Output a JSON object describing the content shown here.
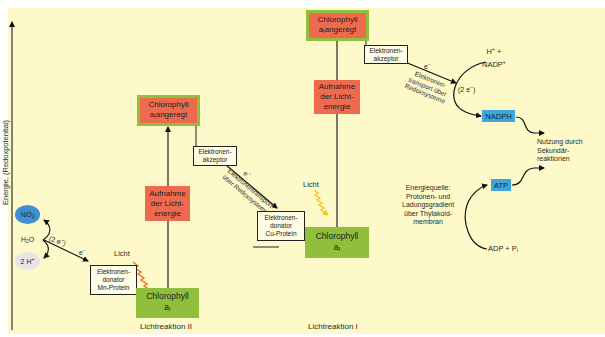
{
  "axis": {
    "label": "Energie, (Redoxpotential)"
  },
  "photosystem_II": {
    "caption": "Lichtreaktion II",
    "chlorophyll_ground": {
      "line1": "Chlorophyll",
      "line2": "a",
      "sub": "I"
    },
    "chlorophyll_excited": {
      "line1": "Chlorophyll",
      "line2a": "a",
      "sub": "I",
      "line2b": "angeregt"
    },
    "light_absorption": {
      "line1": "Aufnahme",
      "line2": "der Licht-",
      "line3": "energie"
    },
    "light_label": "Licht",
    "donor": {
      "line1": "Elektronen-",
      "line2": "donator",
      "line3": "Mn-Protein"
    },
    "acceptor": {
      "line1": "Elektronen-",
      "line2": "akzeptor"
    },
    "transport": {
      "electron": "e",
      "electron_sup": "−",
      "line1": "Elektronentransport",
      "line2": "über Redoxsysteme"
    }
  },
  "photosystem_I": {
    "caption": "Lichtreaktion I",
    "chlorophyll_ground": {
      "line1": "Chlorophyll",
      "line2": "a",
      "sub": "I"
    },
    "chlorophyll_excited": {
      "line1": "Chlorophyll",
      "line2a": "a",
      "sub": "I",
      "line2b": "angeregt"
    },
    "light_absorption": {
      "line1": "Aufnahme",
      "line2": "der Licht-",
      "line3": "energie"
    },
    "light_label": "Licht",
    "donor": {
      "line1": "Elektronen-",
      "line2": "donator",
      "line3": "Cu-Protein"
    },
    "acceptor": {
      "line1": "Elektronen-",
      "line2": "akzeptor"
    },
    "transport": {
      "electron": "e",
      "electron_sup": "−",
      "line1": "Elektronen-",
      "line2": "transport über",
      "line3": "Redoxsysteme"
    }
  },
  "water_splitting": {
    "oxygen": {
      "frac": "½",
      "mol": "O",
      "sub": "2"
    },
    "water": {
      "mol": "H",
      "sub": "2",
      "tail": "O"
    },
    "protons": {
      "text": "2 H",
      "sup": "+"
    },
    "two_electrons": {
      "text": "(2 e",
      "sup": "−",
      "close": ")"
    },
    "electron": {
      "text": "e",
      "sup": "−"
    }
  },
  "nadp": {
    "input_line1": "H",
    "input_line1_sup": "+",
    "input_line1_tail": " +",
    "input_line2": "NADP",
    "input_line2_sup": "+",
    "two_electrons": {
      "text": "(2 e",
      "sup": "−",
      "close": ")"
    },
    "product": "NADPH"
  },
  "atp": {
    "product": "ATP",
    "input": "ADP + P",
    "input_sub": "i",
    "energy_source": {
      "line1": "Energiequelle:",
      "line2": "Protonen- und",
      "line3": "Ladungsgradient",
      "line4": "über Thylakoid-",
      "line5": "membran"
    }
  },
  "usage": {
    "line1": "Nutzung durch",
    "line2": "Sekundär-",
    "line3": "reaktionen"
  },
  "colors": {
    "background": "#fdf9c9",
    "excited_box": "#ee6a4f",
    "ground_box": "#8fbf3c",
    "product_box": "#3fa6dc",
    "light_psII": "#f06a1f",
    "light_psI": "#f5c21b",
    "oxygen": "#3f8fd2",
    "protons": "#e6e6ea"
  }
}
